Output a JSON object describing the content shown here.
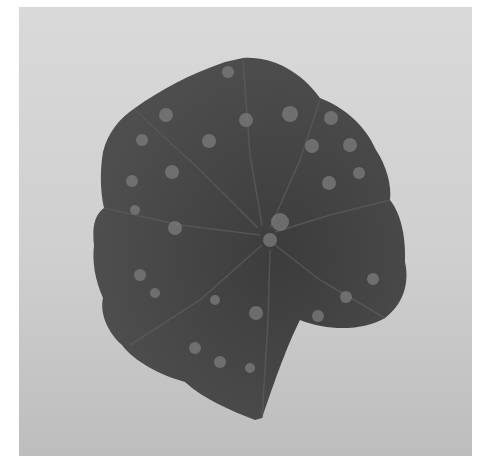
{
  "image": {
    "subject": "leaf with circular lesion spots",
    "colors": {
      "background_border": "#ffffff",
      "backdrop": "#d2d2d2",
      "leaf": "#4a4a4a",
      "leaf_dark": "#3a3a3a",
      "spot": "#7c7c7c",
      "vein": "#5e5e5e"
    },
    "spots": [
      [
        166,
        115,
        7
      ],
      [
        228,
        72,
        6
      ],
      [
        142,
        140,
        6
      ],
      [
        209,
        141,
        7
      ],
      [
        246,
        120,
        7
      ],
      [
        290,
        114,
        8
      ],
      [
        312,
        146,
        7
      ],
      [
        350,
        145,
        7
      ],
      [
        331,
        118,
        7
      ],
      [
        132,
        181,
        6
      ],
      [
        172,
        172,
        7
      ],
      [
        329,
        183,
        7
      ],
      [
        359,
        173,
        6
      ],
      [
        135,
        210,
        5
      ],
      [
        175,
        228,
        7
      ],
      [
        280,
        222,
        9
      ],
      [
        270,
        240,
        7
      ],
      [
        140,
        275,
        6
      ],
      [
        155,
        293,
        5
      ],
      [
        346,
        297,
        6
      ],
      [
        373,
        279,
        6
      ],
      [
        256,
        313,
        7
      ],
      [
        318,
        316,
        6
      ],
      [
        195,
        348,
        6
      ],
      [
        220,
        362,
        6
      ],
      [
        250,
        368,
        5
      ],
      [
        215,
        300,
        5
      ]
    ]
  }
}
